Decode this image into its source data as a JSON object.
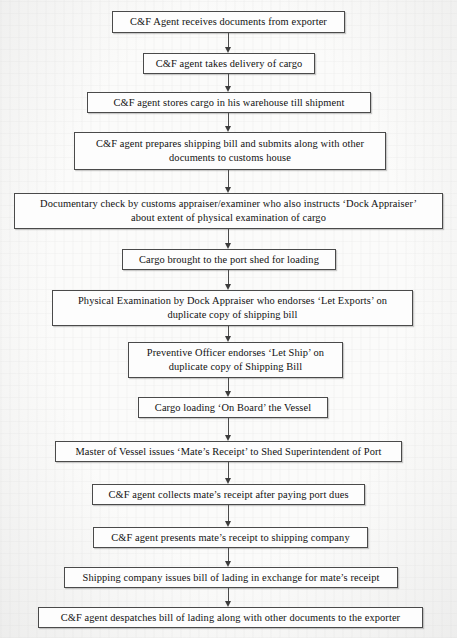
{
  "document": {
    "kind": "flowchart",
    "title": "Export procedure flowchart — C&F agent and customs clearance",
    "orientation": "vertical",
    "paper_color": "#fbfbfa",
    "ink_color": "#111111",
    "border_color": "#4a4a4a"
  },
  "flowchart": {
    "arrow_count": 13,
    "nodes": [
      {
        "id": "n1",
        "text": "C&F Agent receives documents from exporter",
        "lines": [
          "C&F Agent receives documents from exporter"
        ],
        "x": 112,
        "y": 11,
        "width": 233,
        "height": 22
      },
      {
        "id": "n2",
        "text": "C&F agent takes delivery of cargo",
        "lines": [
          "C&F agent takes delivery of cargo"
        ],
        "x": 143,
        "y": 53,
        "width": 172,
        "height": 21
      },
      {
        "id": "n3",
        "text": "C&F agent stores cargo in his warehouse till shipment",
        "lines": [
          "C&F agent stores cargo in his warehouse till shipment"
        ],
        "x": 87,
        "y": 92,
        "width": 284,
        "height": 21
      },
      {
        "id": "n4",
        "text": "C&F agent prepares shipping bill and submits along with other documents to customs house",
        "lines": [
          "C&F agent prepares shipping bill and submits along with other",
          "documents to customs house"
        ],
        "x": 74,
        "y": 132,
        "width": 312,
        "height": 38
      },
      {
        "id": "n5",
        "text": "Documentary check by customs appraiser/examiner who also instructs ‘Dock Appraiser’ about extent of physical examination of cargo",
        "lines": [
          "Documentary check by customs appraiser/examiner who also instructs ‘Dock Appraiser’",
          "about extent of physical examination of cargo"
        ],
        "x": 14,
        "y": 193,
        "width": 429,
        "height": 36
      },
      {
        "id": "n6",
        "text": "Cargo brought to the port shed for loading",
        "lines": [
          "Cargo brought to the port shed for loading"
        ],
        "x": 122,
        "y": 249,
        "width": 214,
        "height": 21
      },
      {
        "id": "n7",
        "text": "Physical Examination by Dock Appraiser who endorses ‘Let Exports’ on duplicate copy of shipping bill",
        "lines": [
          "Physical Examination by Dock Appraiser who endorses ‘Let Exports’ on",
          "duplicate copy of shipping bill"
        ],
        "x": 52,
        "y": 290,
        "width": 361,
        "height": 36
      },
      {
        "id": "n8",
        "text": "Preventive Officer endorses ‘Let Ship’ on duplicate copy of Shipping Bill",
        "lines": [
          "Preventive Officer endorses ‘Let Ship’ on",
          "duplicate copy of Shipping Bill"
        ],
        "x": 128,
        "y": 342,
        "width": 215,
        "height": 36
      },
      {
        "id": "n9",
        "text": "Cargo loading ‘On Board’ the Vessel",
        "lines": [
          "Cargo loading ‘On Board’ the Vessel"
        ],
        "x": 138,
        "y": 397,
        "width": 190,
        "height": 21
      },
      {
        "id": "n10",
        "text": "Master of Vessel issues ‘Mate’s Receipt’ to Shed Superintendent of Port",
        "lines": [
          "Master of Vessel issues ‘Mate’s Receipt’ to Shed Superintendent of Port"
        ],
        "x": 55,
        "y": 441,
        "width": 347,
        "height": 21
      },
      {
        "id": "n11",
        "text": "C&F agent collects mate’s receipt after paying port dues",
        "lines": [
          "C&F agent collects mate’s receipt after paying port dues"
        ],
        "x": 92,
        "y": 484,
        "width": 273,
        "height": 21
      },
      {
        "id": "n12",
        "text": "C&F agent presents mate’s receipt to shipping company",
        "lines": [
          "C&F agent presents mate’s receipt to shipping company"
        ],
        "x": 93,
        "y": 527,
        "width": 275,
        "height": 21
      },
      {
        "id": "n13",
        "text": "Shipping company issues bill of lading in exchange for mate’s receipt",
        "lines": [
          "Shipping company issues bill of lading in exchange for mate’s receipt"
        ],
        "x": 64,
        "y": 567,
        "width": 334,
        "height": 21
      },
      {
        "id": "n14",
        "text": "C&F agent despatches bill of lading along with other documents to the exporter",
        "lines": [
          "C&F agent despatches bill of lading along with other documents to the exporter"
        ],
        "x": 38,
        "y": 607,
        "width": 385,
        "height": 21
      }
    ]
  }
}
